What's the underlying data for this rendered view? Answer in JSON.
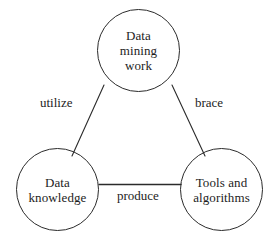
{
  "diagram": {
    "type": "cycle-triangle",
    "background_color": "#ffffff",
    "stroke_color": "#2b2b2b",
    "text_color": "#1d1d1d",
    "nodes": [
      {
        "id": "data-mining-work",
        "label": "Data\nmining\nwork",
        "shape": "circle",
        "center": {
          "x": 138,
          "y": 50
        },
        "diameter": 83
      },
      {
        "id": "data-knowledge",
        "label": "Data\nknowledge",
        "shape": "circle",
        "center": {
          "x": 57,
          "y": 190
        },
        "diameter": 83
      },
      {
        "id": "tools-and-algorithms",
        "label": "Tools and\nalgorithms",
        "shape": "circle",
        "center": {
          "x": 221,
          "y": 190
        },
        "diameter": 83
      }
    ],
    "edges": [
      {
        "id": "edge-utilize",
        "label": "utilize",
        "from": "data-mining-work",
        "to": "data-knowledge",
        "style": "solid-line",
        "from_point": {
          "x": 104,
          "y": 85
        },
        "to_point": {
          "x": 72,
          "y": 156
        }
      },
      {
        "id": "edge-brace",
        "label": "brace",
        "from": "data-mining-work",
        "to": "tools-and-algorithms",
        "style": "solid-line",
        "from_point": {
          "x": 172,
          "y": 85
        },
        "to_point": {
          "x": 205,
          "y": 156
        }
      },
      {
        "id": "edge-produce",
        "label": "produce",
        "from": "data-knowledge",
        "to": "tools-and-algorithms",
        "style": "solid-line",
        "from_point": {
          "x": 99,
          "y": 184
        },
        "to_point": {
          "x": 180,
          "y": 184
        }
      }
    ]
  },
  "caption": {
    "cropped_text": ""
  }
}
